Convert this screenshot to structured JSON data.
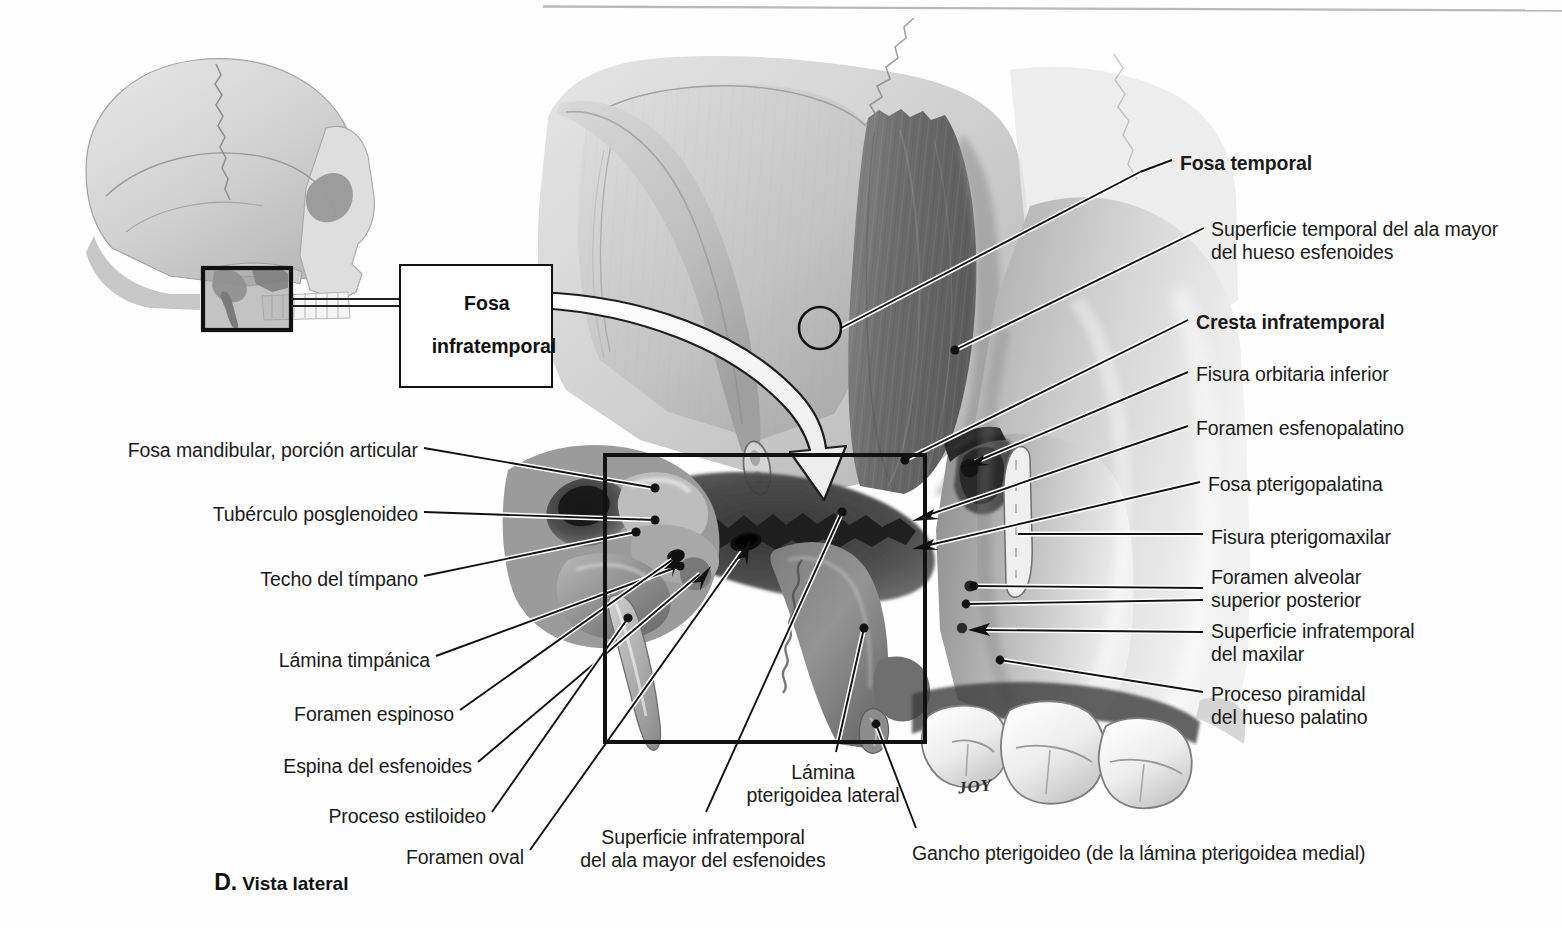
{
  "figure": {
    "caption_letter": "D.",
    "caption_text": "Vista lateral",
    "artist_signature": "JOY",
    "callout": {
      "line1": "Fosa",
      "line2": "infratemporal"
    }
  },
  "colors": {
    "page_background": "#fefefe",
    "ink": "#1b1b1b",
    "leader_line": "#111111",
    "leader_halo": "#ffffff",
    "bone_light": "#d8d8d8",
    "bone_mid": "#b4b4b4",
    "bone_dark": "#8a8a8a",
    "sphenoid_dark": "#6f6f6f",
    "fossa_shadow": "#3a3a3a",
    "rule": "#b9b9b9",
    "frame": "#111111"
  },
  "rule": {
    "present": true
  },
  "labels_right": [
    {
      "id": "fosa-temporal",
      "text": "Fosa temporal",
      "bold": true,
      "x": 1180,
      "y": 152,
      "lines": 1
    },
    {
      "id": "superficie-temporal-ala-mayor",
      "text": "Superficie temporal del ala mayor\ndel hueso esfenoides",
      "bold": false,
      "x": 1211,
      "y": 218,
      "lines": 2
    },
    {
      "id": "cresta-infratemporal",
      "text": "Cresta infratemporal",
      "bold": true,
      "x": 1196,
      "y": 311,
      "lines": 1
    },
    {
      "id": "fisura-orbitaria-inferior",
      "text": "Fisura orbitaria inferior",
      "bold": false,
      "x": 1196,
      "y": 363,
      "lines": 1
    },
    {
      "id": "foramen-esfenopalatino",
      "text": "Foramen esfenopalatino",
      "bold": false,
      "x": 1196,
      "y": 417,
      "lines": 1
    },
    {
      "id": "fosa-pterigopalatina",
      "text": "Fosa pterigopalatina",
      "bold": false,
      "x": 1208,
      "y": 473,
      "lines": 1
    },
    {
      "id": "fisura-pterigomaxilar",
      "text": "Fisura pterigomaxilar",
      "bold": false,
      "x": 1211,
      "y": 526,
      "lines": 1
    },
    {
      "id": "foramen-alveolar-superior-posterior",
      "text": "Foramen alveolar\nsuperior posterior",
      "bold": false,
      "x": 1211,
      "y": 566,
      "lines": 2
    },
    {
      "id": "superficie-infratemporal-maxilar",
      "text": "Superficie infratemporal\ndel maxilar",
      "bold": false,
      "x": 1211,
      "y": 620,
      "lines": 2
    },
    {
      "id": "proceso-piramidal-hueso-palatino",
      "text": "Proceso piramidal\ndel hueso palatino",
      "bold": false,
      "x": 1211,
      "y": 683,
      "lines": 2
    }
  ],
  "labels_left": [
    {
      "id": "fosa-mandibular-porcion-articular",
      "text": "Fosa mandibular, porción articular",
      "right": 1140,
      "x": 146,
      "y": 439
    },
    {
      "id": "tuberculo-posglenoideo",
      "text": "Tubérculo posglenoideo",
      "right": 1140,
      "x": 227,
      "y": 503
    },
    {
      "id": "techo-del-timpano",
      "text": "Techo del tímpano",
      "right": 1140,
      "x": 271,
      "y": 568
    },
    {
      "id": "lamina-timpanica",
      "text": "Lámina timpánica",
      "right": 1140,
      "x": 285,
      "y": 649
    },
    {
      "id": "foramen-espinoso",
      "text": "Foramen espinoso",
      "right": 1140,
      "x": 307,
      "y": 703
    },
    {
      "id": "espina-del-esfenoides",
      "text": "Espina del esfenoides",
      "right": 1140,
      "x": 299,
      "y": 755
    },
    {
      "id": "proceso-estiloideo",
      "text": "Proceso estiloideo",
      "right": 1140,
      "x": 343,
      "y": 805
    },
    {
      "id": "foramen-oval",
      "text": "Foramen oval",
      "right": 1140,
      "x": 411,
      "y": 846
    }
  ],
  "labels_bottom": [
    {
      "id": "superficie-infratemporal-ala-mayor-esfenoides",
      "text": "Superficie infratemporal\ndel ala mayor del esfenoides",
      "x": 583,
      "y": 826,
      "lines": 2
    },
    {
      "id": "lamina-pterigoidea-lateral",
      "text": "Lámina\npterigoidea lateral",
      "x": 755,
      "y": 761,
      "lines": 2
    },
    {
      "id": "gancho-pterigoideo",
      "text": "Gancho pterigoideo (de la lámina pterigoidea medial)",
      "x": 912,
      "y": 842,
      "lines": 1
    }
  ],
  "markers": {
    "fosa_temporal_circle": {
      "cx": 820,
      "cy": 328,
      "r": 21
    },
    "inset_frame": {
      "x": 203,
      "y": 268,
      "w": 88,
      "h": 62
    },
    "main_frame": {
      "x": 605,
      "y": 455,
      "w": 320,
      "h": 287
    }
  }
}
